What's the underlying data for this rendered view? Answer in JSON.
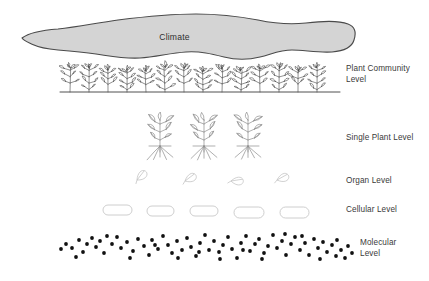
{
  "figure": {
    "type": "hierarchical-levels-diagram",
    "background_color": "#ffffff",
    "levels": [
      {
        "id": "climate",
        "label": "Climate"
      },
      {
        "id": "plant_community",
        "label": "Plant Community\nLevel"
      },
      {
        "id": "single_plant",
        "label": "Single Plant Level"
      },
      {
        "id": "organ",
        "label": "Organ Level"
      },
      {
        "id": "cellular",
        "label": "Cellular Level"
      },
      {
        "id": "molecular",
        "label": "Molecular\nLevel"
      }
    ]
  },
  "colors": {
    "climate_fill": "#d4d4d4",
    "climate_stroke": "#4a4a4a",
    "label_text": "#3a3a3a",
    "plant_ink": "#4d4d4d",
    "single_plant_ink": "#8c8c8c",
    "organ_ink": "#c2c2c2",
    "cell_stroke": "#c8c8c8",
    "cell_fill": "#ffffff",
    "molecule_fill": "#111111",
    "ground_line": "#3d3d3d"
  },
  "chart_data": {
    "type": "diagram",
    "climate_blob": {
      "label": "Climate",
      "fill": "#d4d4d4",
      "stroke": "#4a4a4a",
      "bounds": {
        "x": 20,
        "y": 12,
        "width": 336,
        "height": 50
      }
    },
    "plant_community": {
      "count": 14,
      "ground_line": {
        "x1": 60,
        "y1": 92,
        "x2": 340,
        "y2": 92
      },
      "x_positions": [
        70,
        89,
        108,
        127,
        146,
        165,
        184,
        203,
        222,
        241,
        260,
        279,
        298,
        317
      ]
    },
    "single_plants": {
      "count": 3,
      "x_positions": [
        160,
        204,
        248
      ],
      "baseline_y": 152
    },
    "organs": {
      "count": 4,
      "leaves": [
        {
          "x": 137,
          "y": 180,
          "rotation": -35
        },
        {
          "x": 185,
          "y": 181,
          "rotation": -20
        },
        {
          "x": 231,
          "y": 181,
          "rotation": 8
        },
        {
          "x": 277,
          "y": 180,
          "rotation": -12
        }
      ]
    },
    "cells": {
      "count": 5,
      "shape": "capsule",
      "capsules": [
        {
          "x": 103,
          "y": 205,
          "width": 29,
          "height": 10
        },
        {
          "x": 147,
          "y": 206,
          "width": 27,
          "height": 10
        },
        {
          "x": 190,
          "y": 206,
          "width": 28,
          "height": 10
        },
        {
          "x": 234,
          "y": 207,
          "width": 30,
          "height": 11
        },
        {
          "x": 280,
          "y": 207,
          "width": 29,
          "height": 11
        }
      ]
    },
    "molecules": {
      "count": 76,
      "dot_radius": 1.9,
      "points": [
        [
          72,
          248
        ],
        [
          79,
          240
        ],
        [
          87,
          244
        ],
        [
          92,
          238
        ],
        [
          96,
          247
        ],
        [
          100,
          241
        ],
        [
          104,
          253
        ],
        [
          112,
          244
        ],
        [
          117,
          237
        ],
        [
          121,
          248
        ],
        [
          127,
          242
        ],
        [
          133,
          251
        ],
        [
          138,
          239
        ],
        [
          144,
          246
        ],
        [
          149,
          255
        ],
        [
          152,
          240
        ],
        [
          158,
          249
        ],
        [
          163,
          236
        ],
        [
          168,
          245
        ],
        [
          172,
          253
        ],
        [
          177,
          241
        ],
        [
          182,
          250
        ],
        [
          187,
          238
        ],
        [
          191,
          247
        ],
        [
          196,
          256
        ],
        [
          200,
          243
        ],
        [
          205,
          235
        ],
        [
          209,
          250
        ],
        [
          214,
          241
        ],
        [
          219,
          252
        ],
        [
          223,
          245
        ],
        [
          228,
          237
        ],
        [
          232,
          249
        ],
        [
          237,
          258
        ],
        [
          241,
          243
        ],
        [
          246,
          236
        ],
        [
          250,
          251
        ],
        [
          255,
          244
        ],
        [
          259,
          239
        ],
        [
          264,
          253
        ],
        [
          268,
          246
        ],
        [
          273,
          235
        ],
        [
          277,
          248
        ],
        [
          282,
          241
        ],
        [
          286,
          255
        ],
        [
          291,
          244
        ],
        [
          295,
          237
        ],
        [
          300,
          250
        ],
        [
          305,
          243
        ],
        [
          309,
          255
        ],
        [
          314,
          239
        ],
        [
          318,
          248
        ],
        [
          323,
          242
        ],
        [
          327,
          252
        ],
        [
          332,
          245
        ],
        [
          337,
          240
        ],
        [
          341,
          250
        ],
        [
          345,
          258
        ],
        [
          83,
          252
        ],
        [
          107,
          236
        ],
        [
          130,
          258
        ],
        [
          155,
          245
        ],
        [
          178,
          258
        ],
        [
          199,
          252
        ],
        [
          220,
          259
        ],
        [
          243,
          250
        ],
        [
          262,
          259
        ],
        [
          285,
          234
        ],
        [
          302,
          236
        ],
        [
          320,
          259
        ],
        [
          336,
          256
        ],
        [
          66,
          244
        ],
        [
          61,
          249
        ],
        [
          348,
          246
        ],
        [
          352,
          253
        ],
        [
          76,
          257
        ]
      ]
    }
  }
}
